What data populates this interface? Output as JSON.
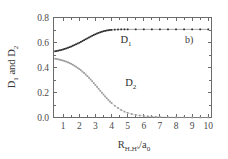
{
  "figure": {
    "panel_label": "b)",
    "background": "#ffffff",
    "axis_color": "#6b6b6b"
  },
  "chart_data": {
    "type": "scatter",
    "title": "",
    "subtitle": "",
    "xlabel_parts": {
      "base": "R",
      "sub": "HₐHᵇ",
      "divider": "/a",
      "sub2": "0"
    },
    "xlabel": "R_HaHb/a0",
    "ylabel_parts": {
      "d1": "D",
      "d1sub": "1",
      "conj": " and ",
      "d2": "D",
      "d2sub": "2"
    },
    "ylabel": "D1 and D2",
    "xlim": [
      0.4,
      10.2
    ],
    "ylim": [
      0.0,
      0.8
    ],
    "xticks": [
      1,
      2,
      3,
      4,
      5,
      6,
      7,
      8,
      9,
      10
    ],
    "xticklabels": [
      "1",
      "2",
      "3",
      "4",
      "5",
      "6",
      "7",
      "8",
      "9",
      "10"
    ],
    "yticks": [
      0.0,
      0.2,
      0.4,
      0.6,
      0.8
    ],
    "yticklabels": [
      "0.0",
      "0.2",
      "0.4",
      "0.6",
      "0.8"
    ],
    "grid": false,
    "legend_position": "inline-annotations",
    "annotations": [
      {
        "text": "D1",
        "x": 4.55,
        "y": 0.6,
        "name": "d1-curve-label"
      },
      {
        "text": "D2",
        "x": 4.85,
        "y": 0.255,
        "name": "d2-curve-label"
      },
      {
        "text": "b)",
        "x": 8.55,
        "y": 0.6,
        "name": "panel-label"
      }
    ],
    "marker": {
      "shape": "square",
      "size": 1.7
    },
    "series": [
      {
        "name": "D1",
        "color": "#2b2b2b",
        "x": [
          0.5,
          0.6,
          0.7,
          0.8,
          0.9,
          1.0,
          1.1,
          1.2,
          1.3,
          1.4,
          1.5,
          1.6,
          1.7,
          1.8,
          1.9,
          2.0,
          2.1,
          2.2,
          2.3,
          2.4,
          2.5,
          2.6,
          2.7,
          2.8,
          2.9,
          3.0,
          3.1,
          3.2,
          3.3,
          3.4,
          3.5,
          3.6,
          3.7,
          3.8,
          3.9,
          4.0,
          4.2,
          4.4,
          4.6,
          4.8,
          5.0,
          5.5,
          6.0,
          6.5,
          7.0,
          7.5,
          8.0,
          8.5,
          9.0,
          9.5,
          10.0
        ],
        "y": [
          0.53,
          0.532,
          0.535,
          0.538,
          0.541,
          0.545,
          0.549,
          0.553,
          0.558,
          0.563,
          0.568,
          0.574,
          0.58,
          0.586,
          0.592,
          0.598,
          0.605,
          0.612,
          0.619,
          0.626,
          0.633,
          0.64,
          0.647,
          0.654,
          0.66,
          0.666,
          0.672,
          0.677,
          0.682,
          0.686,
          0.69,
          0.693,
          0.696,
          0.698,
          0.7,
          0.701,
          0.703,
          0.704,
          0.705,
          0.705,
          0.705,
          0.705,
          0.705,
          0.705,
          0.705,
          0.705,
          0.705,
          0.705,
          0.705,
          0.705,
          0.705
        ]
      },
      {
        "name": "D2",
        "color": "#9a9a9a",
        "x": [
          0.5,
          0.6,
          0.7,
          0.8,
          0.9,
          1.0,
          1.1,
          1.2,
          1.3,
          1.4,
          1.5,
          1.6,
          1.7,
          1.8,
          1.9,
          2.0,
          2.1,
          2.2,
          2.3,
          2.4,
          2.5,
          2.6,
          2.7,
          2.8,
          2.9,
          3.0,
          3.1,
          3.2,
          3.3,
          3.4,
          3.5,
          3.6,
          3.7,
          3.8,
          3.9,
          4.0,
          4.2,
          4.4,
          4.6,
          4.8,
          5.0,
          5.25,
          5.5,
          5.75,
          6.0,
          6.25,
          6.5,
          6.75,
          7.0,
          7.5,
          8.0,
          8.5,
          9.0,
          9.5,
          10.0
        ],
        "y": [
          0.47,
          0.468,
          0.465,
          0.462,
          0.459,
          0.455,
          0.451,
          0.446,
          0.441,
          0.435,
          0.429,
          0.422,
          0.414,
          0.406,
          0.397,
          0.388,
          0.378,
          0.367,
          0.356,
          0.344,
          0.331,
          0.318,
          0.304,
          0.29,
          0.275,
          0.26,
          0.245,
          0.23,
          0.214,
          0.199,
          0.184,
          0.169,
          0.155,
          0.141,
          0.128,
          0.116,
          0.094,
          0.076,
          0.06,
          0.047,
          0.037,
          0.028,
          0.021,
          0.016,
          0.012,
          0.009,
          0.007,
          0.005,
          0.004,
          0.002,
          0.001,
          0.001,
          0.0,
          0.0,
          0.0
        ]
      }
    ]
  }
}
